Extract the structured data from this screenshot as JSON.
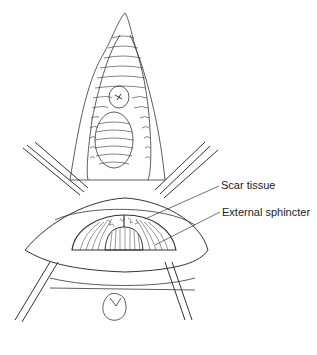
{
  "figure": {
    "type": "surgical-illustration",
    "labels": [
      {
        "id": "scar",
        "text": "Scar tissue"
      },
      {
        "id": "ext",
        "text": "External sphincter"
      }
    ],
    "colors": {
      "line": "#333333",
      "background": "#ffffff"
    }
  }
}
